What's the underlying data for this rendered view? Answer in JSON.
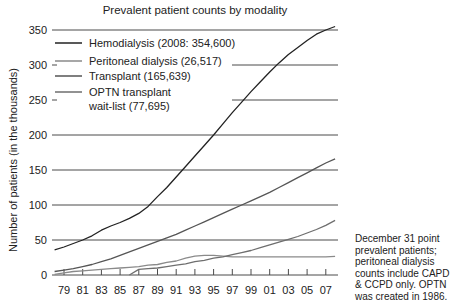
{
  "chart_data": {
    "type": "line",
    "title": "Prevalent patient counts by modality",
    "xlabel": "",
    "ylabel": "Number of patients (in the thousands)",
    "ylim": [
      0,
      350
    ],
    "yticks": [
      0,
      50,
      100,
      150,
      200,
      250,
      300,
      350
    ],
    "xlim": [
      1978,
      2008
    ],
    "xtick_labels": [
      "79",
      "81",
      "83",
      "85",
      "87",
      "89",
      "91",
      "93",
      "95",
      "97",
      "99",
      "01",
      "03",
      "05",
      "07"
    ],
    "grid": "horizontal",
    "legend_position": "upper-left",
    "x": [
      1978,
      1979,
      1980,
      1981,
      1982,
      1983,
      1984,
      1985,
      1986,
      1987,
      1988,
      1989,
      1990,
      1991,
      1992,
      1993,
      1994,
      1995,
      1996,
      1997,
      1998,
      1999,
      2000,
      2001,
      2002,
      2003,
      2004,
      2005,
      2006,
      2007,
      2008
    ],
    "series": [
      {
        "name": "Hemodialysis (2008: 354,600)",
        "color": "#222222",
        "values": [
          36,
          40,
          45,
          50,
          56,
          64,
          70,
          75,
          81,
          88,
          98,
          112,
          125,
          140,
          155,
          170,
          185,
          200,
          216,
          232,
          247,
          262,
          276,
          290,
          303,
          315,
          325,
          335,
          344,
          350,
          355
        ]
      },
      {
        "name": "Peritoneal dialysis (26,517)",
        "color": "#8a8a8a",
        "values": [
          1,
          3,
          5,
          6,
          7,
          8,
          9,
          10,
          11,
          12,
          14,
          15,
          18,
          20,
          24,
          27,
          28,
          28,
          27,
          26,
          26,
          26,
          26,
          26,
          26,
          26,
          26,
          26,
          26,
          26,
          26.5
        ]
      },
      {
        "name": "Transplant (165,639)",
        "color": "#555555",
        "values": [
          5,
          7,
          9,
          12,
          15,
          19,
          23,
          28,
          33,
          38,
          43,
          48,
          53,
          58,
          64,
          70,
          76,
          82,
          88,
          94,
          100,
          106,
          112,
          118,
          125,
          132,
          139,
          146,
          153,
          160,
          166
        ]
      },
      {
        "name": "OPTN transplant wait-list (77,695)",
        "color": "#6e6e6e",
        "values": [
          null,
          null,
          null,
          null,
          null,
          null,
          null,
          null,
          0,
          8,
          9,
          10,
          12,
          14,
          16,
          19,
          21,
          24,
          26,
          29,
          32,
          35,
          39,
          43,
          47,
          51,
          55,
          60,
          65,
          71,
          78
        ]
      }
    ],
    "annotations": [
      "December 31 point prevalent patients; peritoneal dialysis counts include CAPD & CCPD only. OPTN was created in 1986."
    ]
  },
  "legend": [
    {
      "label": "Hemodialysis (2008: 354,600)",
      "color": "#222222"
    },
    {
      "label": "Peritoneal dialysis (26,517)",
      "color": "#8a8a8a"
    },
    {
      "label": "Transplant (165,639)",
      "color": "#555555"
    },
    {
      "label": "OPTN transplant",
      "label2": "wait-list (77,695)",
      "color": "#6e6e6e"
    }
  ],
  "note_lines": [
    "December 31 point",
    "prevalent patients;",
    "peritoneal dialysis",
    "counts include CAPD",
    "& CCPD only. OPTN",
    "was created in 1986."
  ]
}
